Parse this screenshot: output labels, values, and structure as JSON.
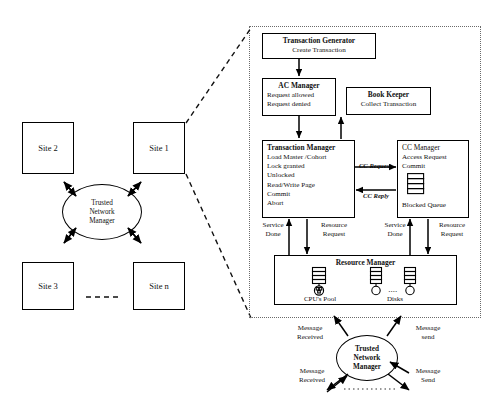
{
  "left_diagram": {
    "sites": [
      {
        "id": "site-2",
        "label": "Site 2"
      },
      {
        "id": "site-1",
        "label": "Site 1"
      },
      {
        "id": "site-3",
        "label": "Site  3"
      },
      {
        "id": "site-n",
        "label": "Site n"
      }
    ],
    "hub": {
      "label": "Trusted\nNetwork\nManager",
      "line1": "Trusted",
      "line2": "Network",
      "line3": "Manager"
    },
    "ellipsis_between_sites": "– – – – –"
  },
  "panel": {
    "transaction_generator": {
      "title": "Transaction Generator",
      "lines": [
        "Create Transaction"
      ]
    },
    "ac_manager": {
      "title": "AC Manager",
      "lines": [
        "Request allowed",
        "Request denied"
      ]
    },
    "book_keeper": {
      "title": "Book Keeper",
      "lines": [
        "Collect Transaction"
      ]
    },
    "transaction_manager": {
      "title": "Transaction Manager",
      "lines": [
        "Load Master /Cohort",
        "Lock granted",
        "Unlocked",
        "Read/Write  Page",
        "Commit",
        "Abort"
      ]
    },
    "cc_manager": {
      "title": "CC Manager",
      "lines": [
        "Access Request",
        "Commit"
      ],
      "queue_label": "Blocked Queue"
    },
    "cc_links": {
      "request": "CC Request",
      "reply": "CC Reply"
    },
    "tm_rm_links": {
      "service_done_l1": "Service",
      "service_done_l2": "Done",
      "resource_request_l1": "Resource",
      "resource_request_l2": "Request"
    },
    "ccm_rm_links": {
      "service_done_l1": "Service",
      "service_done_l2": "Done",
      "resource_request_l1": "Resource",
      "resource_request_l2": "Request"
    },
    "resource_manager": {
      "title": "Resource Manager",
      "cpu_label": "CPU's Pool",
      "disks_label": "Disks",
      "disks_ellipsis": "...."
    }
  },
  "bottom_network": {
    "hub": {
      "line1": "Trusted",
      "line2": "Network",
      "line3": "Manager"
    },
    "labels": {
      "top_left_l1": "Message",
      "top_left_l2": "Received",
      "top_right_l1": "Message",
      "top_right_l2": "send",
      "bottom_left_l1": "Message",
      "bottom_left_l2": "Received",
      "bottom_right_l1": "Message",
      "bottom_right_l2": "Send"
    }
  }
}
